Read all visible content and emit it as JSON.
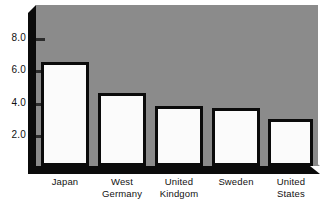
{
  "chart_data": {
    "type": "bar",
    "title": "",
    "subtitle": "",
    "xlabel": "",
    "ylabel": "",
    "categories": [
      "Japan",
      "West Germany",
      "United Kindgom",
      "Sweden",
      "United States"
    ],
    "values": [
      6.4,
      4.5,
      3.7,
      3.6,
      2.9
    ],
    "ylim": [
      0,
      9.0
    ],
    "ytick_labels": [
      "8.0",
      "6.0",
      "4.0",
      "2.0"
    ],
    "ytick_values": [
      8.0,
      6.0,
      4.0,
      2.0
    ],
    "grid": false,
    "legend": null,
    "annotations": [],
    "style": {
      "plot_background": "#8b8b8b",
      "bar_fill": "#fbfbfb",
      "bar_border": "#0b0b0b",
      "axis_color": "#0b0b0b",
      "page_background": "#ffffff",
      "text_color": "#111111"
    }
  },
  "categories_display": [
    {
      "line1": "Japan",
      "line2": ""
    },
    {
      "line1": "West",
      "line2": "Germany"
    },
    {
      "line1": "United",
      "line2": "Kindgom"
    },
    {
      "line1": "Sweden",
      "line2": ""
    },
    {
      "line1": "United",
      "line2": "States"
    }
  ]
}
